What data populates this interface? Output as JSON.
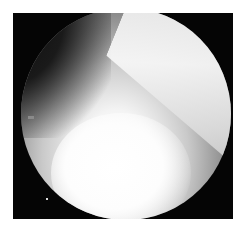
{
  "image": {
    "kind": "arthroscopic view",
    "description": "Grayscale circular endoscopic field of view on a black square background with white margin",
    "colors": {
      "background": "#ffffff",
      "frame": "#050505",
      "brightest": "#ffffff",
      "mid_tissue": "#9a9a9a",
      "dark_region": "#1a1a1a"
    }
  }
}
